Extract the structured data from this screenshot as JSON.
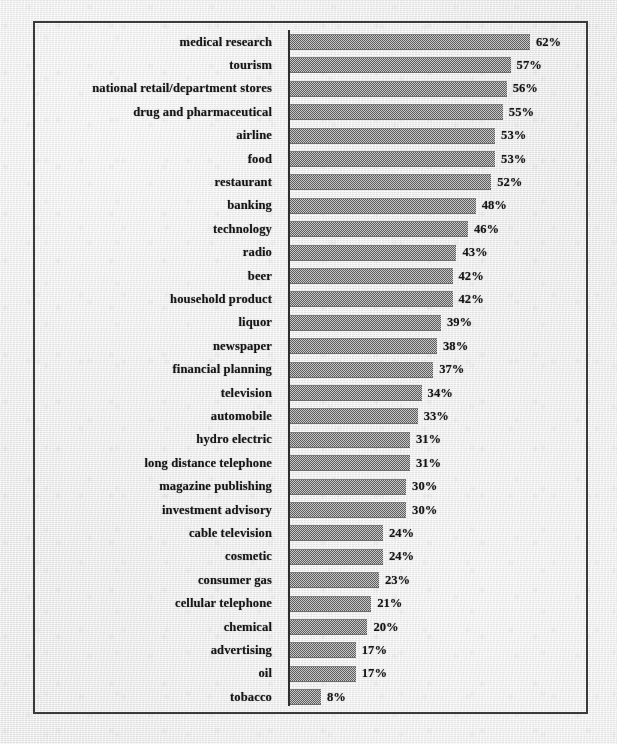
{
  "figure": {
    "background_color": "#eeeeee",
    "frame_color": "#3a3a3a",
    "bar_color": "#8c8c8c",
    "text_color": "#161616"
  },
  "chart_data": {
    "type": "bar",
    "orientation": "horizontal",
    "title": "",
    "subtitle": "",
    "xlabel": "",
    "ylabel": "",
    "xlim": [
      0,
      62
    ],
    "grid": false,
    "legend": null,
    "value_suffix": "%",
    "categories": [
      "medical research",
      "tourism",
      "national retail/department stores",
      "drug and pharmaceutical",
      "airline",
      "food",
      "restaurant",
      "banking",
      "technology",
      "radio",
      "beer",
      "household product",
      "liquor",
      "newspaper",
      "financial planning",
      "television",
      "automobile",
      "hydro electric",
      "long distance telephone",
      "magazine publishing",
      "investment advisory",
      "cable television",
      "cosmetic",
      "consumer gas",
      "cellular telephone",
      "chemical",
      "advertising",
      "oil",
      "tobacco"
    ],
    "values": [
      62,
      57,
      56,
      55,
      53,
      53,
      52,
      48,
      46,
      43,
      42,
      42,
      39,
      38,
      37,
      34,
      33,
      31,
      31,
      30,
      30,
      24,
      24,
      23,
      21,
      20,
      17,
      17,
      8
    ],
    "value_labels": [
      "62%",
      "57%",
      "56%",
      "55%",
      "53%",
      "53%",
      "52%",
      "48%",
      "46%",
      "43%",
      "42%",
      "42%",
      "39%",
      "38%",
      "37%",
      "34%",
      "33%",
      "31%",
      "31%",
      "30%",
      "30%",
      "24%",
      "24%",
      "23%",
      "21%",
      "20%",
      "17%",
      "17%",
      "8%"
    ]
  }
}
